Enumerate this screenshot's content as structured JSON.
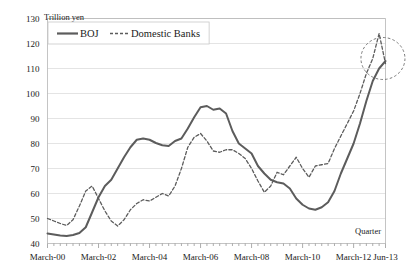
{
  "chart_data": {
    "type": "line",
    "title": "",
    "xlabel": "Quarter",
    "ylabel": "",
    "unit_label": "Trillion yen",
    "ylim": [
      40,
      130
    ],
    "ytick_step": 10,
    "yticks": [
      40,
      50,
      60,
      70,
      80,
      90,
      100,
      110,
      120,
      130
    ],
    "grid": true,
    "legend_position": "top-left",
    "x_tick_labels": [
      "March-00",
      "March-02",
      "March-04",
      "March-06",
      "March-08",
      "March-10",
      "March-12",
      "Jun-13"
    ],
    "x_tick_indices": [
      0,
      8,
      16,
      24,
      32,
      40,
      48,
      53
    ],
    "x_minor_ticks": 54,
    "x_range_label": "March-00 to Jun-13 (quarterly)",
    "colors": {
      "boj_line": "#5c5c5c",
      "banks_line": "#5c5c5c",
      "gridline": "#d9d9d9",
      "frame": "#b5b5b5",
      "annotation": "#6b6b6b",
      "text": "#1a1a1a",
      "background": "#ffffff"
    },
    "series": [
      {
        "name": "BOJ",
        "style": "solid",
        "values": [
          44.0,
          43.6,
          43.2,
          43.0,
          43.4,
          44.2,
          46.5,
          52.5,
          58.5,
          63.0,
          65.5,
          70.0,
          74.5,
          78.5,
          81.5,
          82.0,
          81.5,
          80.2,
          79.3,
          79.0,
          81.0,
          82.0,
          86.0,
          90.5,
          94.5,
          95.0,
          93.5,
          94.0,
          92.0,
          85.0,
          80.0,
          78.0,
          76.0,
          71.0,
          68.0,
          65.5,
          64.5,
          64.0,
          62.0,
          58.0,
          55.5,
          54.0,
          53.5,
          54.5,
          56.5,
          61.0,
          68.0,
          74.0,
          80.0,
          88.0,
          97.0,
          105.0,
          110.0,
          113.0
        ]
      },
      {
        "name": "Domestic Banks",
        "style": "dashed",
        "values": [
          50.0,
          49.0,
          48.0,
          47.2,
          49.5,
          55.0,
          61.0,
          63.0,
          58.0,
          53.0,
          49.0,
          47.0,
          49.5,
          53.5,
          56.0,
          57.5,
          57.0,
          58.5,
          60.0,
          59.0,
          63.0,
          70.0,
          78.5,
          82.5,
          84.0,
          81.0,
          77.0,
          76.5,
          77.5,
          77.5,
          76.0,
          74.0,
          70.0,
          65.0,
          60.5,
          63.0,
          68.5,
          67.5,
          71.0,
          74.5,
          70.0,
          66.5,
          71.0,
          71.5,
          72.0,
          78.0,
          83.0,
          88.0,
          93.0,
          100.0,
          108.0,
          114.0,
          124.0,
          112.0
        ]
      }
    ],
    "annotations": [
      {
        "name": "convergence-highlight",
        "shape": "ellipse",
        "x_index": 52.6,
        "y_value": 114.0,
        "rx_px": 22,
        "ry_px": 21
      }
    ]
  }
}
